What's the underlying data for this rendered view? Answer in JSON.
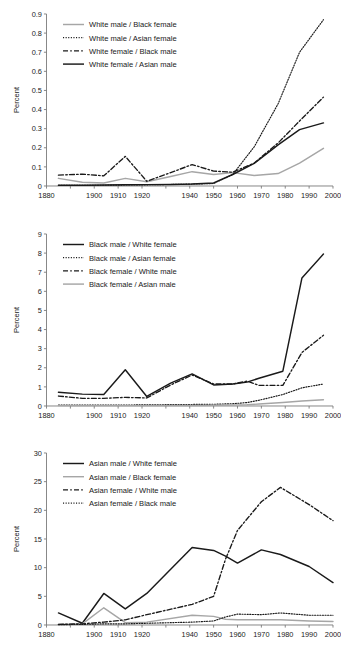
{
  "figure": {
    "axis_label_y": "Percent",
    "x_ticks": [
      "1880",
      "1890",
      "1900",
      "1910",
      "1920",
      "1930",
      "1940",
      "1950",
      "1960",
      "1970",
      "1980",
      "1990",
      "2000"
    ],
    "x_ticks_shown": [
      "1880",
      "1900",
      "1910",
      "1920",
      "1940",
      "1950",
      "1960",
      "1970",
      "1980",
      "1990",
      "2000"
    ],
    "colors": {
      "black": "#1a1a1a",
      "gray": "#a6a6a6",
      "axis": "#7a7a7a"
    }
  },
  "chart_data": [
    {
      "type": "line",
      "title": "",
      "xlabel": "",
      "ylabel": "Percent",
      "xlim": [
        1880,
        2000
      ],
      "ylim": [
        0,
        0.9
      ],
      "ytick_labels": [
        "0",
        "0.1",
        "0.2",
        "0.3",
        "0.4",
        "0.5",
        "0.6",
        "0.7",
        "0.8",
        "0.9"
      ],
      "xtick_labels": [
        "1880",
        "1900",
        "1910",
        "1920",
        "1940",
        "1950",
        "1960",
        "1970",
        "1980",
        "1990",
        "2000"
      ],
      "grid": false,
      "legend_position": "top-left",
      "series": [
        {
          "name": "White male / Black female",
          "style": "solid",
          "color": "#a6a6a6",
          "x": [
            1885,
            1895,
            1904,
            1913,
            1922,
            1932,
            1941,
            1950,
            1958,
            1967,
            1977,
            1986,
            1996
          ],
          "values": [
            0.04,
            0.02,
            0.016,
            0.04,
            0.022,
            0.05,
            0.075,
            0.06,
            0.07,
            0.055,
            0.065,
            0.12,
            0.197
          ]
        },
        {
          "name": "White male / Asian female",
          "style": "dotted",
          "color": "#1a1a1a",
          "x": [
            1885,
            1895,
            1904,
            1913,
            1922,
            1932,
            1941,
            1950,
            1958,
            1967,
            1977,
            1986,
            1996
          ],
          "values": [
            0.004,
            0.004,
            0.004,
            0.005,
            0.006,
            0.008,
            0.01,
            0.013,
            0.06,
            0.205,
            0.43,
            0.7,
            0.87
          ]
        },
        {
          "name": "White female / Black male",
          "style": "dashed",
          "color": "#1a1a1a",
          "x": [
            1885,
            1895,
            1904,
            1913,
            1922,
            1932,
            1941,
            1950,
            1958,
            1967,
            1977,
            1986,
            1996
          ],
          "values": [
            0.057,
            0.062,
            0.053,
            0.155,
            0.025,
            0.07,
            0.112,
            0.078,
            0.072,
            0.12,
            0.225,
            0.34,
            0.465
          ]
        },
        {
          "name": "White female / Asian male",
          "style": "solid",
          "color": "#1a1a1a",
          "x": [
            1885,
            1895,
            1904,
            1913,
            1922,
            1932,
            1941,
            1950,
            1958,
            1967,
            1977,
            1986,
            1996
          ],
          "values": [
            0.004,
            0.004,
            0.005,
            0.006,
            0.007,
            0.008,
            0.01,
            0.016,
            0.06,
            0.118,
            0.215,
            0.295,
            0.33
          ]
        }
      ]
    },
    {
      "type": "line",
      "title": "",
      "xlabel": "",
      "ylabel": "Percent",
      "xlim": [
        1880,
        2000
      ],
      "ylim": [
        0,
        9
      ],
      "ytick_labels": [
        "0",
        "1",
        "2",
        "3",
        "4",
        "5",
        "6",
        "7",
        "8",
        "9"
      ],
      "xtick_labels": [
        "1880",
        "1900",
        "1910",
        "1920",
        "1940",
        "1950",
        "1960",
        "1970",
        "1980",
        "1990",
        "2000"
      ],
      "grid": false,
      "legend_position": "top-left",
      "series": [
        {
          "name": "Black male / White female",
          "style": "solid",
          "color": "#1a1a1a",
          "x": [
            1885,
            1895,
            1904,
            1913,
            1922,
            1932,
            1941,
            1950,
            1958,
            1964,
            1969,
            1979,
            1987,
            1996
          ],
          "values": [
            0.72,
            0.62,
            0.6,
            1.9,
            0.5,
            1.2,
            1.68,
            1.1,
            1.15,
            1.25,
            1.45,
            1.82,
            6.7,
            7.95
          ]
        },
        {
          "name": "Black male / Asian female",
          "style": "dotted",
          "color": "#1a1a1a",
          "x": [
            1885,
            1895,
            1904,
            1913,
            1922,
            1932,
            1941,
            1950,
            1958,
            1964,
            1969,
            1979,
            1987,
            1996
          ],
          "values": [
            0.05,
            0.05,
            0.05,
            0.05,
            0.06,
            0.07,
            0.08,
            0.09,
            0.12,
            0.18,
            0.3,
            0.6,
            0.95,
            1.15
          ]
        },
        {
          "name": "Black female / White male",
          "style": "dashed",
          "color": "#1a1a1a",
          "x": [
            1885,
            1895,
            1904,
            1913,
            1922,
            1932,
            1941,
            1950,
            1958,
            1964,
            1969,
            1979,
            1987,
            1996
          ],
          "values": [
            0.52,
            0.4,
            0.4,
            0.45,
            0.42,
            1.1,
            1.62,
            1.15,
            1.15,
            1.3,
            1.08,
            1.08,
            2.8,
            3.7
          ]
        },
        {
          "name": "Black female / Asian male",
          "style": "solid",
          "color": "#a6a6a6",
          "x": [
            1885,
            1895,
            1904,
            1913,
            1922,
            1932,
            1941,
            1950,
            1958,
            1964,
            1969,
            1979,
            1987,
            1996
          ],
          "values": [
            0.02,
            0.02,
            0.02,
            0.02,
            0.02,
            0.03,
            0.03,
            0.04,
            0.05,
            0.06,
            0.1,
            0.18,
            0.26,
            0.33
          ]
        }
      ]
    },
    {
      "type": "line",
      "title": "",
      "xlabel": "",
      "ylabel": "Percent",
      "xlim": [
        1880,
        2000
      ],
      "ylim": [
        0,
        30
      ],
      "ytick_labels": [
        "0",
        "5",
        "10",
        "15",
        "20",
        "25",
        "30"
      ],
      "xtick_labels": [
        "1880",
        "1900",
        "1910",
        "1920",
        "1940",
        "1950",
        "1960",
        "1970",
        "1980",
        "1990",
        "2000"
      ],
      "grid": false,
      "legend_position": "top-left",
      "series": [
        {
          "name": "Asian male / White female",
          "style": "solid",
          "color": "#1a1a1a",
          "x": [
            1885,
            1895,
            1904,
            1913,
            1922,
            1941,
            1950,
            1955,
            1960,
            1970,
            1978,
            1990,
            2000
          ],
          "values": [
            2.1,
            0.3,
            5.5,
            2.8,
            5.5,
            13.5,
            13.0,
            12.0,
            10.8,
            13.1,
            12.3,
            10.2,
            7.4
          ]
        },
        {
          "name": "Asian male / Black female",
          "style": "solid",
          "color": "#a6a6a6",
          "x": [
            1885,
            1895,
            1904,
            1913,
            1922,
            1941,
            1950,
            1955,
            1960,
            1970,
            1978,
            1990,
            2000
          ],
          "values": [
            0.1,
            0.2,
            3.0,
            0.4,
            0.5,
            1.7,
            1.5,
            1.0,
            0.9,
            0.9,
            0.9,
            0.7,
            0.6
          ]
        },
        {
          "name": "Asian female / White male",
          "style": "dashed",
          "color": "#1a1a1a",
          "x": [
            1885,
            1895,
            1904,
            1913,
            1922,
            1941,
            1950,
            1955,
            1960,
            1970,
            1978,
            1990,
            2000
          ],
          "values": [
            0.1,
            0.2,
            0.5,
            0.9,
            1.8,
            3.6,
            5.0,
            11.5,
            16.5,
            21.5,
            24.0,
            21.0,
            18.2
          ]
        },
        {
          "name": "Asian female / Black male",
          "style": "dotted",
          "color": "#1a1a1a",
          "x": [
            1885,
            1895,
            1904,
            1913,
            1922,
            1941,
            1950,
            1955,
            1960,
            1970,
            1978,
            1990,
            2000
          ],
          "values": [
            0.05,
            0.1,
            0.2,
            0.2,
            0.3,
            0.5,
            0.7,
            1.4,
            1.9,
            1.8,
            2.1,
            1.7,
            1.7
          ]
        }
      ]
    }
  ]
}
